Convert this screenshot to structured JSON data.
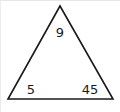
{
  "diagram": {
    "shape": "triangle",
    "stroke_color": "#1a1a1a",
    "values": {
      "top": "9",
      "bottom_left": "5",
      "bottom_right": "45"
    }
  }
}
